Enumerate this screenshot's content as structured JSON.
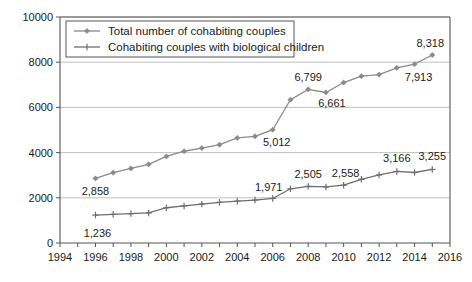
{
  "chart_data": {
    "type": "line",
    "title": "",
    "xlabel": "",
    "ylabel": "Thousands",
    "xlim": [
      1994,
      2016
    ],
    "ylim": [
      0,
      10000
    ],
    "ytick_values": [
      0,
      2000,
      4000,
      6000,
      8000,
      10000
    ],
    "ytick_labels": [
      "0",
      "2000",
      "4000",
      "6000",
      "8000",
      "10000"
    ],
    "xtick_values": [
      1994,
      1996,
      1998,
      2000,
      2002,
      2004,
      2006,
      2008,
      2010,
      2012,
      2014,
      2016
    ],
    "xtick_labels": [
      "1994",
      "1996",
      "1998",
      "2000",
      "2002",
      "2004",
      "2006",
      "2008",
      "2010",
      "2012",
      "2014",
      "2016"
    ],
    "grid": true,
    "legend_position": "top-left",
    "x": [
      1996,
      1997,
      1998,
      1999,
      2000,
      2001,
      2002,
      2003,
      2004,
      2005,
      2006,
      2007,
      2008,
      2009,
      2010,
      2011,
      2012,
      2013,
      2014,
      2015
    ],
    "series": [
      {
        "name": "Total number of cohabiting couples",
        "color": "#8a8a8a",
        "marker": "diamond",
        "values": [
          2858,
          3110,
          3300,
          3480,
          3830,
          4060,
          4200,
          4350,
          4650,
          4720,
          5012,
          6340,
          6799,
          6661,
          7100,
          7380,
          7450,
          7750,
          7913,
          8318
        ],
        "labels": [
          {
            "x": 1996,
            "value": 2858,
            "text": "2,858"
          },
          {
            "x": 2006,
            "value": 5012,
            "text": "5,012"
          },
          {
            "x": 2008,
            "value": 6799,
            "text": "6,799"
          },
          {
            "x": 2009,
            "value": 6661,
            "text": "6,661"
          },
          {
            "x": 2014,
            "value": 7913,
            "text": "7,913"
          },
          {
            "x": 2015,
            "value": 8318,
            "text": "8,318"
          }
        ]
      },
      {
        "name": "Cohabiting couples with biological children",
        "color": "#6e6e6e",
        "marker": "plus",
        "values": [
          1236,
          1270,
          1300,
          1330,
          1560,
          1640,
          1720,
          1800,
          1850,
          1900,
          1971,
          2400,
          2505,
          2480,
          2558,
          2820,
          3010,
          3166,
          3120,
          3255
        ],
        "labels": [
          {
            "x": 1996,
            "value": 1236,
            "text": "1,236"
          },
          {
            "x": 2006,
            "value": 1971,
            "text": "1,971"
          },
          {
            "x": 2008,
            "value": 2505,
            "text": "2,505"
          },
          {
            "x": 2010,
            "value": 2558,
            "text": "2,558"
          },
          {
            "x": 2013,
            "value": 3166,
            "text": "3,166"
          },
          {
            "x": 2015,
            "value": 3255,
            "text": "3,255"
          }
        ]
      }
    ]
  },
  "legend": {
    "items": [
      {
        "label": "Total number of cohabiting couples"
      },
      {
        "label": "Cohabiting couples with biological children"
      }
    ]
  },
  "axis": {
    "ylabel": "Thousands"
  }
}
